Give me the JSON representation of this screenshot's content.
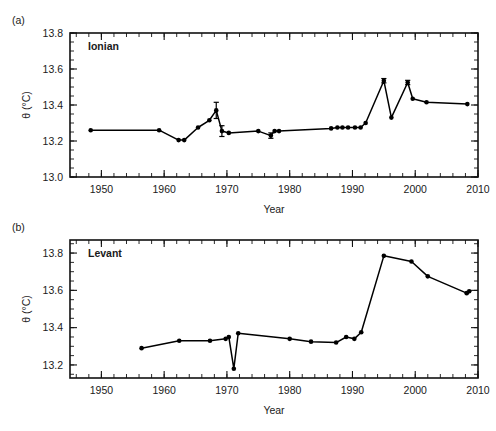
{
  "figure": {
    "panels": [
      {
        "letter": "(a)",
        "series_label": "Ionian",
        "xlabel": "Year",
        "ylabel": "θ (°C)"
      },
      {
        "letter": "(b)",
        "series_label": "Levant",
        "xlabel": "Year",
        "ylabel": "θ (°C)"
      }
    ]
  },
  "chart_data": [
    {
      "type": "line",
      "title": "Ionian",
      "panel": "(a)",
      "xlabel": "Year",
      "ylabel": "θ (°C)",
      "xlim": [
        1945,
        2010
      ],
      "ylim": [
        13.0,
        13.8
      ],
      "xticks": [
        1950,
        1960,
        1970,
        1980,
        1990,
        2000,
        2010
      ],
      "yticks": [
        13.0,
        13.2,
        13.4,
        13.6,
        13.8
      ],
      "xtick_labels": [
        "1950",
        "1960",
        "1970",
        "1980",
        "1990",
        "2000",
        "2010"
      ],
      "ytick_labels": [
        "13.0",
        "13.2",
        "13.4",
        "13.6",
        "13.8"
      ],
      "minor_tick_interval_x": 2,
      "minor_tick_interval_y": 0.05,
      "grid": false,
      "legend": "none",
      "marker": "filled-circle",
      "x": [
        1948.3,
        1959.2,
        1962.3,
        1963.2,
        1965.4,
        1967.2,
        1968.3,
        1969.2,
        1970.3,
        1975.0,
        1977.0,
        1977.6,
        1978.3,
        1986.6,
        1987.6,
        1988.4,
        1989.3,
        1990.4,
        1991.3,
        1992.1,
        1995.0,
        1996.2,
        1998.8,
        1999.6,
        2001.8,
        2008.3
      ],
      "y": [
        13.26,
        13.26,
        13.205,
        13.205,
        13.275,
        13.315,
        13.37,
        13.255,
        13.245,
        13.255,
        13.23,
        13.255,
        13.255,
        13.27,
        13.275,
        13.275,
        13.275,
        13.275,
        13.275,
        13.3,
        13.535,
        13.33,
        13.525,
        13.435,
        13.415,
        13.405
      ],
      "error_bars": [
        {
          "x": 1968.3,
          "y": 13.37,
          "yerr": 0.045
        },
        {
          "x": 1969.2,
          "y": 13.255,
          "yerr": 0.03
        },
        {
          "x": 1977.0,
          "y": 13.23,
          "yerr": 0.015
        },
        {
          "x": 1995.0,
          "y": 13.535,
          "yerr": 0.012
        },
        {
          "x": 1998.8,
          "y": 13.525,
          "yerr": 0.012
        }
      ]
    },
    {
      "type": "line",
      "title": "Levant",
      "panel": "(b)",
      "xlabel": "Year",
      "ylabel": "θ (°C)",
      "xlim": [
        1945,
        2010
      ],
      "ylim": [
        13.13,
        13.87
      ],
      "xticks": [
        1950,
        1960,
        1970,
        1980,
        1990,
        2000,
        2010
      ],
      "yticks": [
        13.2,
        13.4,
        13.6,
        13.8
      ],
      "xtick_labels": [
        "1950",
        "1960",
        "1970",
        "1980",
        "1990",
        "2000",
        "2010"
      ],
      "ytick_labels": [
        "13.2",
        "13.4",
        "13.6",
        "13.8"
      ],
      "minor_tick_interval_x": 2,
      "minor_tick_interval_y": 0.05,
      "grid": false,
      "legend": "none",
      "marker": "filled-circle",
      "x": [
        1956.4,
        1962.4,
        1967.3,
        1969.8,
        1970.3,
        1971.1,
        1971.8,
        1980.0,
        1983.4,
        1987.4,
        1989.0,
        1990.3,
        1991.4,
        1995.0,
        1999.4,
        2002.0,
        2008.2,
        2008.6
      ],
      "y": [
        13.29,
        13.33,
        13.33,
        13.34,
        13.35,
        13.18,
        13.37,
        13.34,
        13.325,
        13.32,
        13.35,
        13.34,
        13.375,
        13.785,
        13.755,
        13.675,
        13.585,
        13.595
      ]
    }
  ]
}
